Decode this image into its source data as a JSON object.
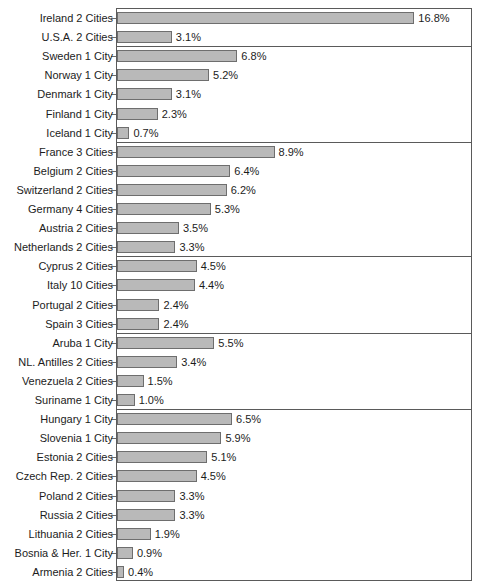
{
  "chart_data": {
    "type": "bar",
    "orientation": "horizontal",
    "title": "",
    "subtitle": "",
    "xlabel": "",
    "ylabel": "",
    "grid": false,
    "legend": false,
    "value_suffix": "%",
    "xlim": [
      0,
      20
    ],
    "axis_scale_px_per_unit": 17.7,
    "categories": [
      "Ireland 2 Cities",
      "U.S.A.  2 Cities",
      "Sweden 1 City",
      "Norway 1 City",
      "Denmark 1 City",
      "Finland 1 City",
      "Iceland 1 City",
      "France 3 Cities",
      "Belgium 2 Cities",
      "Switzerland 2 Cities",
      "Germany  4 Cities",
      "Austria 2 Cities",
      "Netherlands 2 Cities",
      "Cyprus 2 Cities",
      "Italy 10 Cities",
      "Portugal 2 Cities",
      "Spain 3 Cities",
      "Aruba 1 City",
      "NL. Antilles 2 Cities",
      "Venezuela 2 Cities",
      "Suriname 1 City",
      "Hungary 1 City",
      "Slovenia 1 City",
      "Estonia 2 Cities",
      "Czech Rep. 2 Cities",
      "Poland 2 Cities",
      "Russia 2 Cities",
      "Lithuania 2 Cities",
      "Bosnia & Her. 1 City",
      "Armenia 2 Cities"
    ],
    "values": [
      16.8,
      3.1,
      6.8,
      5.2,
      3.1,
      2.3,
      0.7,
      8.9,
      6.4,
      6.2,
      5.3,
      3.5,
      3.3,
      4.5,
      4.4,
      2.4,
      2.4,
      5.5,
      3.4,
      1.5,
      1.0,
      6.5,
      5.9,
      5.1,
      4.5,
      3.3,
      3.3,
      1.9,
      0.9,
      0.4
    ],
    "value_labels": [
      "16.8%",
      "3.1%",
      "6.8%",
      "5.2%",
      "3.1%",
      "2.3%",
      "0.7%",
      "8.9%",
      "6.4%",
      "6.2%",
      "5.3%",
      "3.5%",
      "3.3%",
      "4.5%",
      "4.4%",
      "2.4%",
      "2.4%",
      "5.5%",
      "3.4%",
      "1.5%",
      "1.0%",
      "6.5%",
      "5.9%",
      "5.1%",
      "4.5%",
      "3.3%",
      "3.3%",
      "1.9%",
      "0.9%",
      "0.4%"
    ],
    "group_break_after_index": [
      1,
      6,
      12,
      16,
      20
    ],
    "bar_color": "#b9b9b9",
    "bar_border_color": "#6e6e6e",
    "frame_color": "#5a5a5a",
    "text_color": "#1c1c1c"
  }
}
